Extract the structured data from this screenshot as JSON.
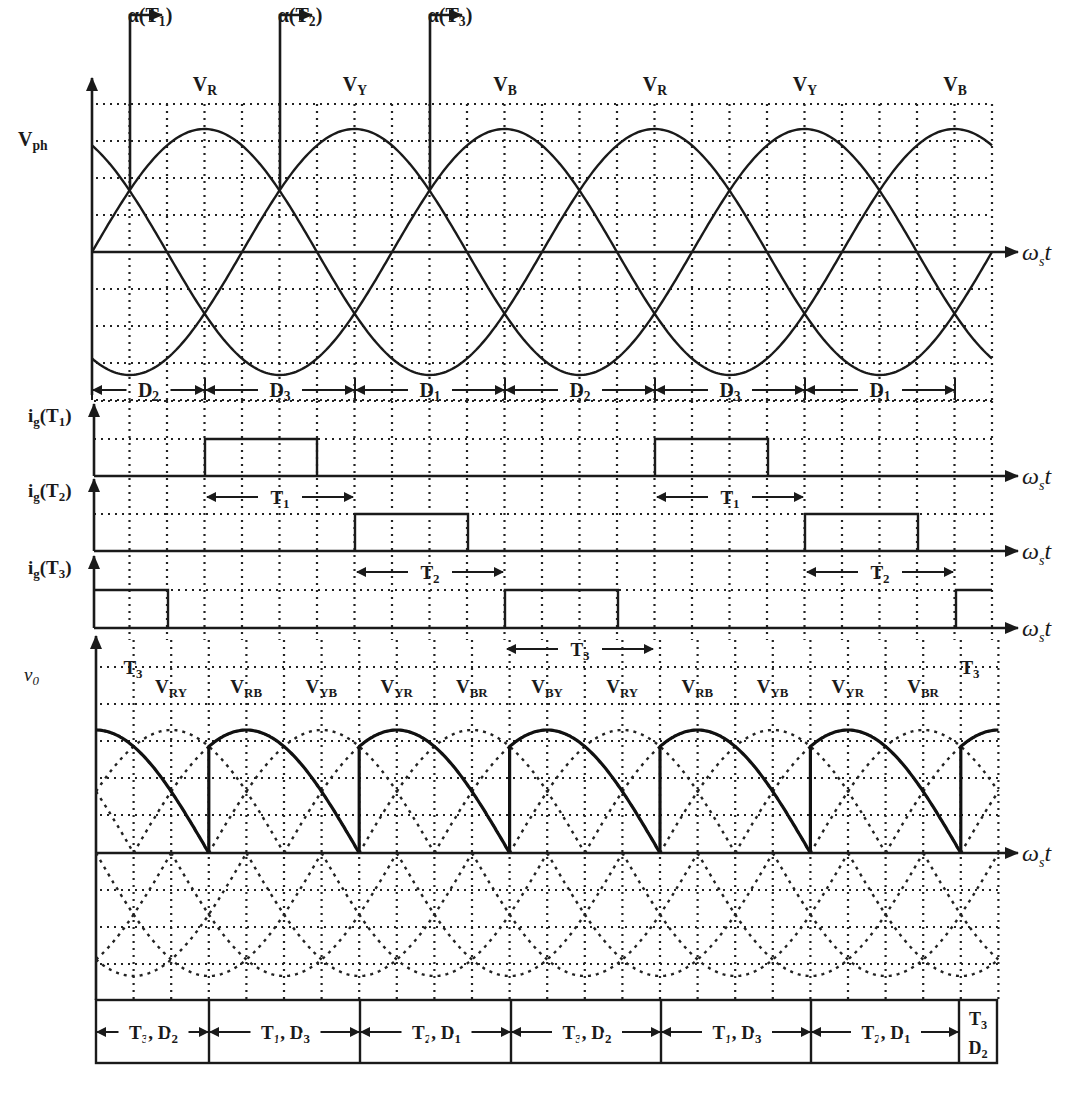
{
  "figure": {
    "axis_label_time": "ω",
    "axis_label_time_sub": "s",
    "axis_label_time_t": "t",
    "colors": {
      "ink": "#1a1a1a",
      "background": "#ffffff"
    }
  },
  "phase_plot": {
    "y_label": "V",
    "y_label_sub": "ph",
    "phase_labels": [
      {
        "main": "V",
        "sub": "R",
        "x": 205
      },
      {
        "main": "V",
        "sub": "Y",
        "x": 355
      },
      {
        "main": "V",
        "sub": "B",
        "x": 505
      },
      {
        "main": "V",
        "sub": "R",
        "x": 655
      },
      {
        "main": "V",
        "sub": "Y",
        "x": 805
      },
      {
        "main": "V",
        "sub": "B",
        "x": 955
      }
    ],
    "firing_markers": [
      {
        "label": "α(T",
        "sub": "1",
        "close": ")",
        "x": 130
      },
      {
        "label": "α(T",
        "sub": "2",
        "close": ")",
        "x": 280
      },
      {
        "label": "α(T",
        "sub": "3",
        "close": ")",
        "x": 430
      }
    ],
    "diode_intervals": [
      {
        "label": "D",
        "sub": "2",
        "x1": 92,
        "x2": 205
      },
      {
        "label": "D",
        "sub": "3",
        "x1": 205,
        "x2": 355
      },
      {
        "label": "D",
        "sub": "1",
        "x1": 355,
        "x2": 505
      },
      {
        "label": "D",
        "sub": "2",
        "x1": 505,
        "x2": 655
      },
      {
        "label": "D",
        "sub": "3",
        "x1": 655,
        "x2": 805
      },
      {
        "label": "D",
        "sub": "1",
        "x1": 805,
        "x2": 955
      }
    ]
  },
  "gate_plot": {
    "signals": [
      {
        "label": "i",
        "label_sub": "g",
        "name": "(T",
        "name_sub": "1",
        "close": ")",
        "pulses": [
          [
            205,
            317
          ],
          [
            655,
            768
          ]
        ],
        "conduction": [
          {
            "label": "T",
            "sub": "1",
            "x1": 205,
            "x2": 355
          },
          {
            "label": "T",
            "sub": "1",
            "x1": 655,
            "x2": 805
          }
        ]
      },
      {
        "label": "i",
        "label_sub": "g",
        "name": "(T",
        "name_sub": "2",
        "close": ")",
        "pulses": [
          [
            355,
            468
          ],
          [
            805,
            918
          ]
        ],
        "conduction": [
          {
            "label": "T",
            "sub": "2",
            "x1": 355,
            "x2": 505
          },
          {
            "label": "T",
            "sub": "2",
            "x1": 805,
            "x2": 955
          }
        ]
      },
      {
        "label": "i",
        "label_sub": "g",
        "name": "(T",
        "name_sub": "3",
        "close": ")",
        "pulses": [
          [
            94,
            168
          ],
          [
            505,
            618
          ],
          [
            956,
            992
          ]
        ],
        "conduction": [
          {
            "label": "T",
            "sub": "3",
            "x1": 94,
            "x2": 205,
            "left_only": true
          },
          {
            "label": "T",
            "sub": "3",
            "x1": 505,
            "x2": 655
          },
          {
            "label": "T",
            "sub": "3",
            "x1": 955,
            "x2": 992,
            "right_only": true
          }
        ]
      }
    ]
  },
  "output_plot": {
    "y_label": "v",
    "y_label_sub": "0",
    "line_labels": [
      {
        "main": "V",
        "sub": "RY"
      },
      {
        "main": "V",
        "sub": "RB"
      },
      {
        "main": "V",
        "sub": "YB"
      },
      {
        "main": "V",
        "sub": "YR"
      },
      {
        "main": "V",
        "sub": "BR"
      },
      {
        "main": "V",
        "sub": "BY"
      },
      {
        "main": "V",
        "sub": "RY"
      },
      {
        "main": "V",
        "sub": "RB"
      },
      {
        "main": "V",
        "sub": "YB"
      },
      {
        "main": "V",
        "sub": "YR"
      },
      {
        "main": "V",
        "sub": "BR"
      }
    ]
  },
  "conduction_table": {
    "cells": [
      {
        "text": "T",
        "t_sub": "3",
        "sep": ",  D",
        "d_sub": "2",
        "x1": 96,
        "x2": 209
      },
      {
        "text": "T",
        "t_sub": "1",
        "sep": ", D",
        "d_sub": "3",
        "x1": 209,
        "x2": 360
      },
      {
        "text": "T",
        "t_sub": "2",
        "sep": ", D",
        "d_sub": "1",
        "x1": 360,
        "x2": 511
      },
      {
        "text": "T",
        "t_sub": "3",
        "sep": ", D",
        "d_sub": "2",
        "x1": 511,
        "x2": 661
      },
      {
        "text": "T",
        "t_sub": "1",
        "sep": ", D",
        "d_sub": "3",
        "x1": 661,
        "x2": 811
      },
      {
        "text": "T",
        "t_sub": "2",
        "sep": ", D",
        "d_sub": "1",
        "x1": 811,
        "x2": 959
      }
    ],
    "last_cell": {
      "line1": "T",
      "line1_sub": "3",
      "line2": "D",
      "line2_sub": "2"
    }
  },
  "chart_data": {
    "type": "line",
    "xlabel": "ωst (30° per grid division)",
    "x_degrees_per_division": 30,
    "x_range_degrees": [
      0,
      720
    ],
    "series": [
      {
        "name": "V_R",
        "formula": "sin(θ)"
      },
      {
        "name": "V_Y",
        "formula": "sin(θ-120°)"
      },
      {
        "name": "V_B",
        "formula": "sin(θ-240°)"
      },
      {
        "name": "ig(T1)",
        "pulses_deg": [
          [
            90,
            180
          ],
          [
            450,
            540
          ]
        ]
      },
      {
        "name": "ig(T2)",
        "pulses_deg": [
          [
            210,
            300
          ],
          [
            570,
            660
          ]
        ]
      },
      {
        "name": "ig(T3)",
        "pulses_deg": [
          [
            0,
            60
          ],
          [
            330,
            420
          ],
          [
            690,
            720
          ]
        ]
      },
      {
        "name": "v0",
        "description": "line voltage segments, firing at 90°+120k, falling to zero at 90°+120k"
      }
    ],
    "firing_angles_deg": {
      "T1": 30,
      "T2": 150,
      "T3": 270
    }
  }
}
